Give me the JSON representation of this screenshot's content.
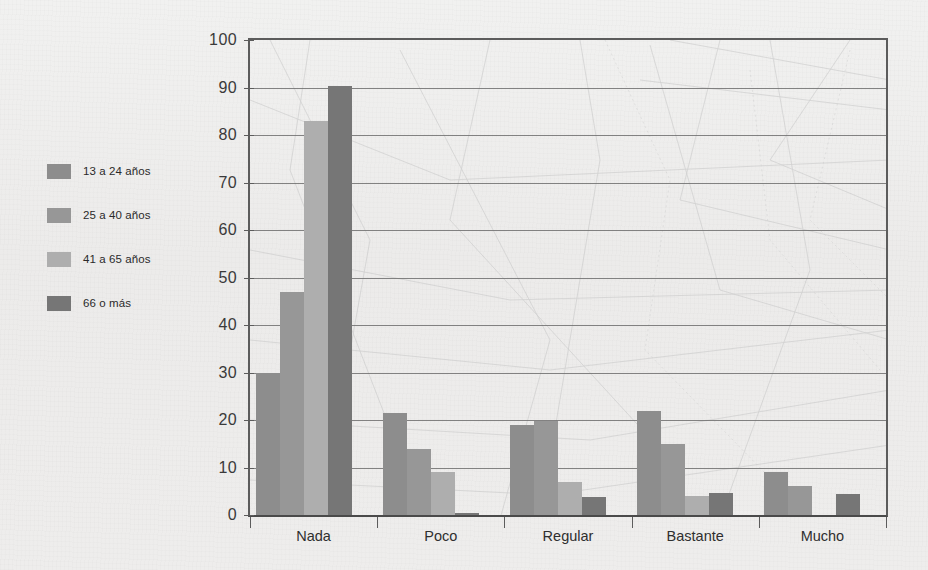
{
  "legend": {
    "position": "left",
    "items": [
      {
        "label": "13 a 24 años",
        "color": "#8d8d8d"
      },
      {
        "label": "25 a 40 años",
        "color": "#979797"
      },
      {
        "label": "41 a 65 años",
        "color": "#aeaeae"
      },
      {
        "label": "66 o más",
        "color": "#767676"
      }
    ]
  },
  "chart_data": {
    "type": "bar",
    "title": "",
    "xlabel": "",
    "ylabel": "",
    "ylim": [
      0,
      100
    ],
    "yticks": [
      0,
      10,
      20,
      30,
      40,
      50,
      60,
      70,
      80,
      90,
      100
    ],
    "grid": true,
    "grid_axis": "y",
    "legend_position": "left",
    "categories": [
      "Nada",
      "Poco",
      "Regular",
      "Bastante",
      "Mucho"
    ],
    "series": [
      {
        "name": "13 a 24 años",
        "color": "#8d8d8d",
        "values": [
          30,
          21.5,
          19,
          22,
          9
        ]
      },
      {
        "name": "25 a 40 años",
        "color": "#979797",
        "values": [
          47,
          14,
          19.7,
          15,
          6.2
        ]
      },
      {
        "name": "41 a 65 años",
        "color": "#aeaeae",
        "values": [
          83,
          9,
          7,
          4,
          0
        ]
      },
      {
        "name": "66 o más",
        "color": "#767676",
        "values": [
          90.3,
          0.5,
          3.8,
          4.7,
          4.5
        ]
      }
    ]
  }
}
